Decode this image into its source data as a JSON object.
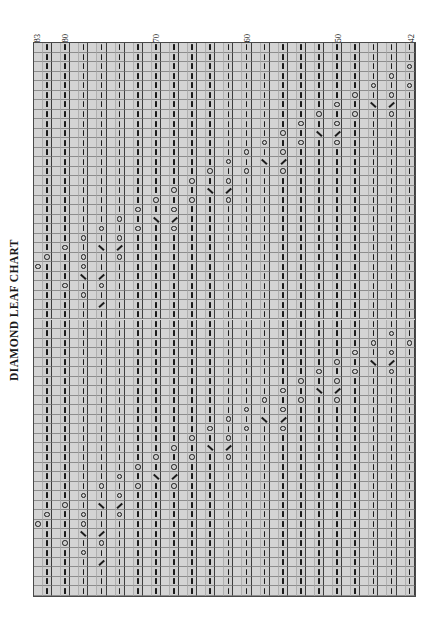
{
  "title": "DIAMOND LEAF CHART",
  "colors": {
    "grid_background": "#d4d4d4",
    "grid_line_minor": "#b0b0b0",
    "grid_line_major": "#3d3d3d",
    "symbol": "#1b1b1b",
    "page_background": "#ffffff"
  },
  "legend_symbols": {
    "k": "knit stitch (vertical bar)",
    "o": "yarn over (open circle)",
    "r": "k2tog right-leaning decrease (slash)",
    "l": "ssk left-leaning decrease (backslash)",
    "b": "blank / no stitch"
  },
  "axis": {
    "column_labels": [
      {
        "text": "83",
        "col": 0
      },
      {
        "text": "80",
        "col": 3
      },
      {
        "text": "70",
        "col": 13
      },
      {
        "text": "60",
        "col": 23
      },
      {
        "text": "50",
        "col": 33
      },
      {
        "text": "42",
        "col": 41
      }
    ],
    "column_count": 42,
    "row_count": 58,
    "column_numbering_direction": "right-to-left, 83 down to 42"
  },
  "chart_data": {
    "type": "table",
    "title": "DIAMOND LEAF CHART",
    "columns": 42,
    "rows": 58,
    "legend": [
      "k = knit",
      "o = yarn over",
      "r = k2tog",
      "l = ssk",
      "b = blank"
    ],
    "grid": [
      "bkbkbkbkbkbkbkbkbkbkbkbkbkbkbkbkbkbkbkbkbk",
      "bkbkbkbkbkbkbkbkbkbkbkbkbkbkbkbkbkbkbkbkbk",
      "bkbkbkbkbkbkbkbkbkbkbkbkbkbkbkbkbkbkbkbkbo",
      "bkbkbkbkbkbkbkbkbkbkbkbkbkbkbkbkbkbkbkbobk",
      "bkbkbkbkbkbkbkbkbkbkbkbkbkbkbkbkbkbkbobkbo",
      "bkbkbkbkbkbkbkbkbkbkbkbkbkbkbkbkbkbobkbobk",
      "bkbkbkbkbkbkbkbkbkbkbkbkbkbkbkbkbobkbrblbk",
      "bkbkbkbkbkbkbkbkbkbkbkbkbkbkbkbobkbobkbobk",
      "bkbkbkbkbkbkbkbkbkbkbkbkbkbkbobkbobkbkbkbk",
      "bkbkbkbkbkbkbkbkbkbkbkbkbkbobkbrblbkbkbkbk",
      "bkbkbkbkbkbkbkbkbkbkbkbkbobkbobkbobkbkbkbk",
      "bkbkbkbkbkbkbkbkbkbkbkbobkbobkbkbkbkbkbkbk",
      "bkbkbkbkbkbkbkbkbkbkbobkbrblbkbkbkbkbkbkbk",
      "bkbkbkbkbkbkbkbkbkbobkbobkbobkbkbkbkbkbkbk",
      "bkbkbkbkbkbkbkbkbobkbobkbkbkbkbkbkbkbkbkbk",
      "bkbkbkbkbkbkbkbobkbrblbkbkbkbkbkbkbkbkbkbk",
      "bkbkbkbkbkbkbobkbobkbobkbkbkbkbkbkbkbkbkbk",
      "bkbkbkbkbkbobkbobkbkbkbkbkbkbkbkbkbkbkbkbk",
      "bkbkbkbkbobkbrblbkbkbkbkbkbkbkbkbkbkbkbkbk",
      "bkbkbkbobkbobkbobkbkbkbkbkbkbkbkbkbkbkbkbk",
      "bkbkbobkbobkbkbkbkbkbkbkbkbkbkbkbkbkbkbkbk",
      "bkbobkbrblbkbkbkbkbkbkbkbkbkbkbkbkbkbkbkbk",
      "bobkbobkbobkbkbkbkbkbkbkbkbkbkbkbkbkbkbkbk",
      "okbkbobkbkbkbkbkbkbkbkbkbkbkbkbkbkbkbkbkbk",
      "bkbkbrblbkbkbkbkbkbkbkbkbkbkbkbkbkbkbkbkbk",
      "bkbobkbobkbkbkbkbkbkbkbkbkbkbkbkbkbkbkbkbk",
      "bkbkbobkbkbkbkbkbkbkbkbkbkbkbkbkbkbkbkbkbk",
      "bkbkbkblbkbkbkbkbkbkbkbkbkbkbkbkbkbkbkbkbk",
      "bkbkbkbkbkbkbkbkbkbkbkbkbkbkbkbkbkbkbkbkbk",
      "bkbkbkbkbkbkbkbkbkbkbkbkbkbkbkbkbkbkbkbkbk",
      "bkbkbkbkbkbkbkbkbkbkbkbkbkbkbkbkbkbkbkbobk",
      "bkbkbkbkbkbkbkbkbkbkbkbkbkbkbkbkbkbkbobkbo",
      "bkbkbkbkbkbkbkbkbkbkbkbkbkbkbkbkbkbobkbobk",
      "bkbkbkbkbkbkbkbkbkbkbkbkbkbkbkbkbobkbrblbk",
      "bkbkbkbkbkbkbkbkbkbkbkbkbkbkbkbobkbobkbobk",
      "bkbkbkbkbkbkbkbkbkbkbkbkbkbkbobkbobkbkbkbk",
      "bkbkbkbkbkbkbkbkbkbkbkbkbkbobkbrblbkbkbkbk",
      "bkbkbkbkbkbkbkbkbkbkbkbkbobkbobkbobkbkbkbk",
      "bkbkbkbkbkbkbkbkbkbkbkbobkbobkbkbkbkbkbkbk",
      "bkbkbkbkbkbkbkbkbkbkbobkbrblbkbkbkbkbkbkbk",
      "bkbkbkbkbkbkbkbkbkbobkbobkbobkbkbkbkbkbkbk",
      "bkbkbkbkbkbkbkbkbobkbobkbkbkbkbkbkbkbkbkbk",
      "bkbkbkbkbkbkbkbobkbrblbkbkbkbkbkbkbkbkbkbk",
      "bkbkbkbkbkbkbobkbobkbobkbkbkbkbkbkbkbkbkbk",
      "bkbkbkbkbkbobkbobkbkbkbkbkbkbkbkbkbkbkbkbk",
      "bkbkbkbkbobkbrblbkbkbkbkbkbkbkbkbkbkbkbkbk",
      "bkbkbkbobkbobkbobkbkbkbkbkbkbkbkbkbkbkbkbk",
      "bkbkbobkbobkbkbkbkbkbkbkbkbkbkbkbkbkbkbkbk",
      "bkbobkbrblbkbkbkbkbkbkbkbkbkbkbkbkbkbkbkbk",
      "bobkbobkbobkbkbkbkbkbkbkbkbkbkbkbkbkbkbkbk",
      "okbkbobkbkbkbkbkbkbkbkbkbkbkbkbkbkbkbkbkbk",
      "bkbkbrblbkbkbkbkbkbkbkbkbkbkbkbkbkbkbkbkbk",
      "bkbobkbobkbkbkbkbkbkbkbkbkbkbkbkbkbkbkbkbk",
      "bkbkbobkbkbkbkbkbkbkbkbkbkbkbkbkbkbkbkbkbk",
      "bkbkbkblbkbkbkbkbkbkbkbkbkbkbkbkbkbkbkbkbk",
      "bkbkbkbkbkbkbkbkbkbkbkbkbkbkbkbkbkbkbkbkbk",
      "bkbkbkbkbkbkbkbkbkbkbkbkbkbkbkbkbkbkbkbkbk",
      "bkbkbkbkbkbkbkbkbkbkbkbkbkbkbkbkbkbkbkbkbk"
    ]
  }
}
